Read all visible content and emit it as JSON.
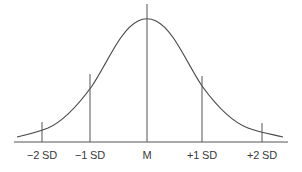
{
  "diagram": {
    "type": "normal-distribution-curve",
    "colors": {
      "line": "#4a4a4a",
      "text": "#3a3a3a",
      "background": "#ffffff"
    },
    "markers": [
      {
        "label": "−2 SD",
        "x": 42
      },
      {
        "label": "−1 SD",
        "x": 90
      },
      {
        "label": "M",
        "x": 147
      },
      {
        "label": "+1 SD",
        "x": 202
      },
      {
        "label": "+2 SD",
        "x": 262
      }
    ]
  }
}
